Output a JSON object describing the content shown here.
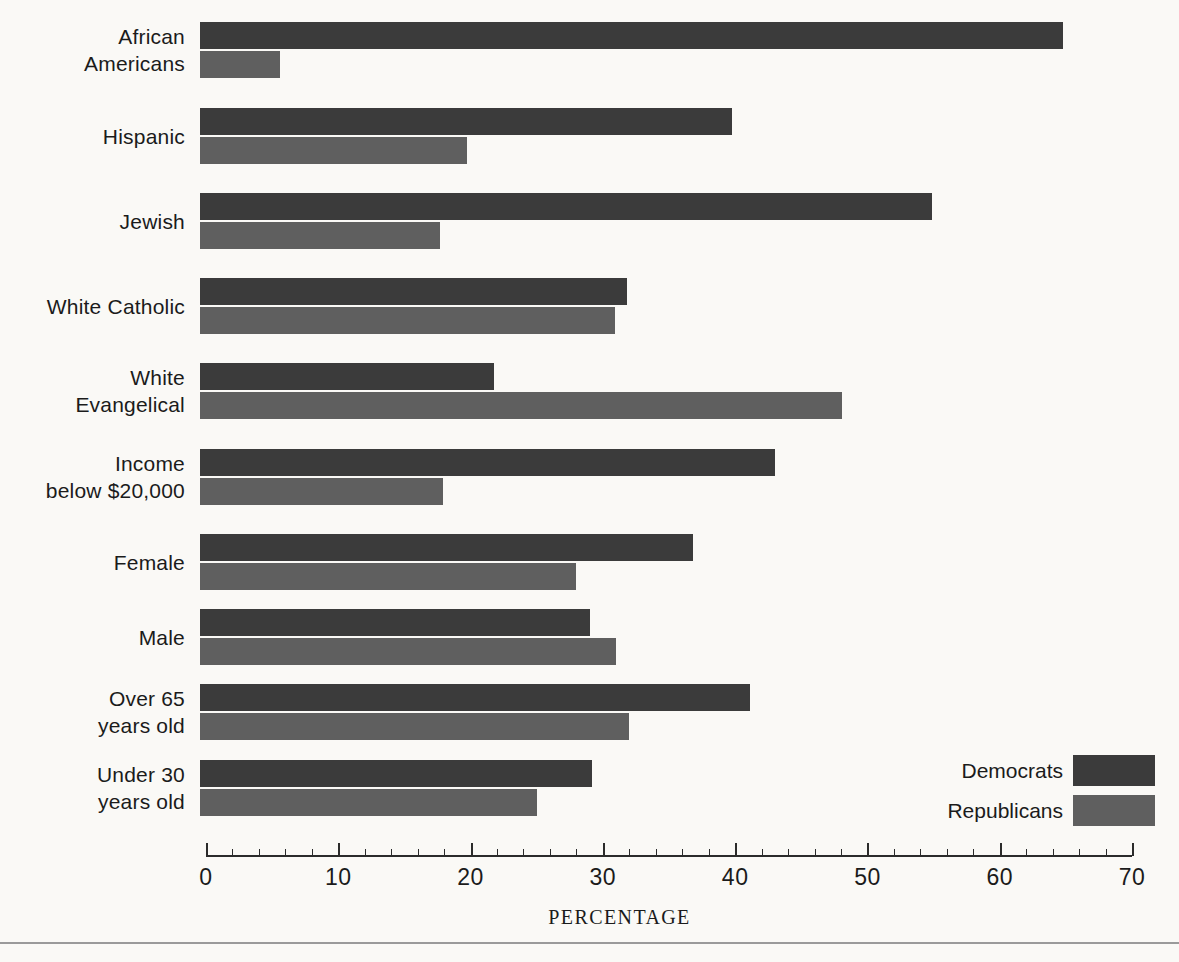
{
  "chart_data": {
    "type": "bar",
    "orientation": "horizontal",
    "title": "",
    "xlabel": "PERCENTAGE",
    "ylabel": "",
    "xlim": [
      0,
      70
    ],
    "xticks": [
      0,
      10,
      20,
      30,
      40,
      50,
      60,
      70
    ],
    "xtick_labels": [
      "0",
      "10",
      "20",
      "30",
      "40",
      "50",
      "60",
      "70"
    ],
    "minor_tick_step": 2,
    "grid": false,
    "legend_position": "bottom-right",
    "categories": [
      "African Americans",
      "Hispanic",
      "Jewish",
      "White Catholic",
      "White Evangelical",
      "Income below $20,000",
      "Female",
      "Male",
      "Over 65 years old",
      "Under 30 years old"
    ],
    "category_label_lines": [
      [
        "African",
        "Americans"
      ],
      [
        "Hispanic"
      ],
      [
        "Jewish"
      ],
      [
        "White Catholic"
      ],
      [
        "White",
        "Evangelical"
      ],
      [
        "Income",
        "below $20,000"
      ],
      [
        "Female"
      ],
      [
        "Male"
      ],
      [
        "Over 65",
        "years old"
      ],
      [
        "Under 30",
        "years old"
      ]
    ],
    "series": [
      {
        "name": "Democrats",
        "color": "#3b3b3b",
        "values": [
          64.8,
          39.8,
          54.9,
          31.8,
          21.8,
          43.0,
          36.8,
          29.0,
          41.1,
          29.2
        ]
      },
      {
        "name": "Republicans",
        "color": "#5f5f5f",
        "values": [
          5.6,
          19.7,
          17.7,
          30.9,
          48.1,
          17.9,
          28.0,
          31.0,
          32.0,
          25.0
        ]
      }
    ]
  },
  "legend": {
    "items": [
      {
        "label": "Democrats",
        "color": "#3b3b3b"
      },
      {
        "label": "Republicans",
        "color": "#5f5f5f"
      }
    ]
  },
  "axis": {
    "title": "PERCENTAGE"
  },
  "colors": {
    "democrat": "#3b3b3b",
    "republican": "#5f5f5f",
    "background": "#faf9f6",
    "axis": "#2b2b2b",
    "rule": "#9a9a9a"
  }
}
